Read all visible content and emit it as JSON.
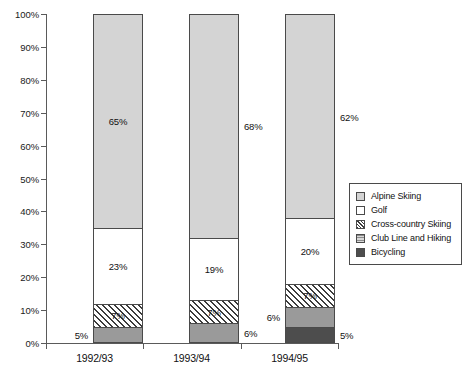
{
  "chart_data": {
    "type": "bar",
    "title": "",
    "xlabel": "",
    "ylabel": "",
    "ylim": [
      0,
      100
    ],
    "grid": false,
    "legend_position": "right",
    "stacked": true,
    "categories": [
      "1992/93",
      "1993/94",
      "1994/95"
    ],
    "y_ticks": [
      "0%",
      "10%",
      "20%",
      "30%",
      "40%",
      "50%",
      "60%",
      "70%",
      "80%",
      "90%",
      "100%"
    ],
    "y_tick_values": [
      0,
      10,
      20,
      30,
      40,
      50,
      60,
      70,
      80,
      90,
      100
    ],
    "series": [
      {
        "name": "Bicycling",
        "values": [
          0,
          0,
          5
        ],
        "labels": [
          "",
          "",
          "5%"
        ],
        "swatch": "fill-bike",
        "label_pos": [
          "none",
          "none",
          "right"
        ]
      },
      {
        "name": "Club Line and Hiking",
        "values": [
          5,
          6,
          6
        ],
        "labels": [
          "5%",
          "6%",
          "6%"
        ],
        "swatch": "fill-club",
        "label_pos": [
          "left",
          "right",
          "left"
        ]
      },
      {
        "name": "Cross-country Skiing",
        "values": [
          7,
          7,
          7
        ],
        "labels": [
          "7%",
          "7%",
          "7%"
        ],
        "swatch": "fill-cross",
        "label_pos": [
          "in",
          "in",
          "in"
        ]
      },
      {
        "name": "Golf",
        "values": [
          23,
          19,
          20
        ],
        "labels": [
          "23%",
          "19%",
          "20%"
        ],
        "swatch": "fill-golf",
        "label_pos": [
          "in",
          "in",
          "in"
        ]
      },
      {
        "name": "Alpine Skiing",
        "values": [
          65,
          68,
          62
        ],
        "labels": [
          "65%",
          "68%",
          "62%"
        ],
        "swatch": "fill-alpine",
        "label_pos": [
          "in-right",
          "right",
          "right"
        ]
      }
    ]
  },
  "legend": {
    "items": [
      {
        "label": "Alpine Skiing",
        "swatch": "fill-alpine"
      },
      {
        "label": "Golf",
        "swatch": "fill-golf"
      },
      {
        "label": "Cross-country Skiing",
        "swatch": "fill-cross"
      },
      {
        "label": "Club Line and Hiking",
        "swatch": "fill-club"
      },
      {
        "label": "Bicycling",
        "swatch": "fill-bike"
      }
    ]
  },
  "colors": {
    "alpine": "#d4d4d4",
    "golf": "#ffffff",
    "cross_country": "#ffffff",
    "club_line": "#9a9a9a",
    "bicycling": "#4d4d4d",
    "axis": "#5a5a5a",
    "outline": "#4a4a4a",
    "text": "#111111"
  }
}
